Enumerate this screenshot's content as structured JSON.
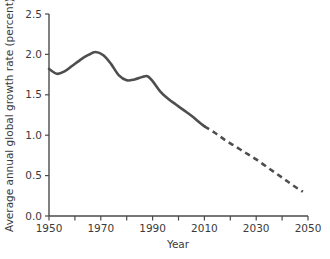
{
  "chart_data": {
    "type": "line",
    "title": "",
    "xlabel": "Year",
    "ylabel": "Average annual global growth rate (percent)",
    "xlim": [
      1950,
      2050
    ],
    "ylim": [
      0.0,
      2.5
    ],
    "grid": false,
    "legend": "none",
    "x_ticks_major": [
      1950,
      1970,
      1990,
      2010,
      2030,
      2050
    ],
    "x_ticks_major_labels": [
      "1950",
      "1970",
      "1990",
      "2010",
      "2030",
      "2050"
    ],
    "x_ticks_minor": [
      1960,
      1980,
      2000,
      2020,
      2040
    ],
    "y_ticks": [
      0.0,
      0.5,
      1.0,
      1.5,
      2.0,
      2.5
    ],
    "y_tick_labels": [
      "0.0",
      "0.5",
      "1.0",
      "1.5",
      "2.0",
      "2.5"
    ],
    "series": [
      {
        "name": "Estimated",
        "style": "solid",
        "color": "#4e4e4e",
        "x": [
          1950,
          1953,
          1956,
          1959,
          1962,
          1965,
          1968,
          1971,
          1974,
          1977,
          1980,
          1983,
          1986,
          1988,
          1990,
          1993,
          1996,
          1999,
          2002,
          2005,
          2008,
          2010
        ],
        "values": [
          1.82,
          1.76,
          1.79,
          1.86,
          1.93,
          1.99,
          2.03,
          1.99,
          1.88,
          1.74,
          1.68,
          1.69,
          1.72,
          1.73,
          1.67,
          1.54,
          1.45,
          1.38,
          1.31,
          1.24,
          1.16,
          1.11
        ]
      },
      {
        "name": "Projected",
        "style": "dashed",
        "color": "#4e4e4e",
        "x": [
          2010,
          2014,
          2018,
          2022,
          2026,
          2030,
          2034,
          2038,
          2042,
          2046,
          2048
        ],
        "values": [
          1.11,
          1.03,
          0.94,
          0.86,
          0.78,
          0.7,
          0.61,
          0.52,
          0.43,
          0.34,
          0.3
        ]
      }
    ]
  }
}
